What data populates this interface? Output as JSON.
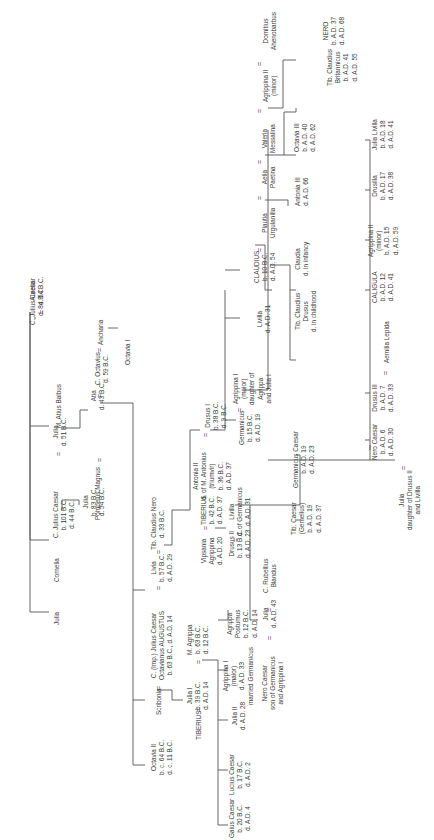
{
  "diagram": {
    "type": "family-tree",
    "orientation": "rotated-90-ccw",
    "line_color": "#555555",
    "text_color": "#3a3a3a",
    "marriage_symbol": "=",
    "nodes": [
      {
        "id": "caesar_sr",
        "lines": [
          "C. Julius Caesar",
          "d. 84 B.C."
        ],
        "x": 38,
        "y": 327
      },
      {
        "id": "aurelia",
        "lines": [
          "Aurelia",
          "d. 54 B.C."
        ],
        "x": 38,
        "y": 305
      },
      {
        "id": "julia_a",
        "lines": [
          "Julia"
        ],
        "x": 64,
        "y": 626
      },
      {
        "id": "cornelia",
        "lines": [
          "Cornelia"
        ],
        "x": 64,
        "y": 570
      },
      {
        "id": "caesar",
        "lines": [
          "C. Julius Caesar",
          "b. 101 B.C.",
          "d. 44 B.C."
        ],
        "x": 62,
        "y": 513
      },
      {
        "id": "julia_b",
        "lines": [
          "Julia",
          "d. 51 B.C."
        ],
        "x": 62,
        "y": 440
      },
      {
        "id": "balbus",
        "lines": [
          "M. Atius Balbus"
        ],
        "x": 62,
        "y": 380
      },
      {
        "id": "julia_c",
        "lines": [
          "Julia",
          "b. 83 B.C.",
          "d. 54 B.C."
        ],
        "x": 103,
        "y": 513
      },
      {
        "id": "pompey",
        "lines": [
          "Pompeius Magnus"
        ],
        "x": 103,
        "y": 450
      },
      {
        "id": "atia",
        "lines": [
          "Atia",
          "d. 43 B.C."
        ],
        "x": 103,
        "y": 400
      },
      {
        "id": "octavius",
        "lines": [
          "C. Octavius",
          "d. 59 B.C."
        ],
        "x": 103,
        "y": 360
      },
      {
        "id": "ancharia",
        "lines": [
          "Ancharia"
        ],
        "x": 103,
        "y": 310
      },
      {
        "id": "octavia1",
        "lines": [
          "Octavia I"
        ],
        "x": 130,
        "y": 365
      },
      {
        "id": "octavia2",
        "lines": [
          "Octavia II",
          "b. c. 64 B.C.",
          "d. c. 11 B.C."
        ],
        "x": 160,
        "y": 755
      },
      {
        "id": "scribonia",
        "lines": [
          "Scribonia"
        ],
        "x": 160,
        "y": 695
      },
      {
        "id": "augustus",
        "lines": [
          "C. (Imp.) Julius Caesar",
          "Octavianus AUGUSTUS",
          "b. 63 B.C., d. A.D. 14"
        ],
        "x": 160,
        "y": 660
      },
      {
        "id": "livia",
        "lines": [
          "Livia",
          "b. 57 B.C.",
          "d. A.D. 29"
        ],
        "x": 160,
        "y": 565
      },
      {
        "id": "tib_nero",
        "lines": [
          "Tib. Claudius Nero",
          "d. 33 B.C."
        ],
        "x": 160,
        "y": 520
      },
      {
        "id": "tiberius_a",
        "lines": [
          "TIBERIUS"
        ],
        "x": 198,
        "y": 735
      },
      {
        "id": "julia1",
        "lines": [
          "Julia I",
          "b. 39 B.C.",
          "d. A.D. 14"
        ],
        "x": 198,
        "y": 690
      },
      {
        "id": "agrippa",
        "lines": [
          "M. Agrippa",
          "b. 63 B.C.",
          "d. 12 B.C."
        ],
        "x": 198,
        "y": 635
      },
      {
        "id": "vipsania",
        "lines": [
          "Vipsania",
          "Agrippina",
          "d. A.D. 20"
        ],
        "x": 212,
        "y": 545
      },
      {
        "id": "tiberius",
        "lines": [
          "TIBERIUS",
          "b. 42 B.C.",
          "d. A.D. 37"
        ],
        "x": 212,
        "y": 505
      },
      {
        "id": "antonia2",
        "lines": [
          "Antonia II",
          "d. of M. Antonius",
          "(triumvir)",
          "b. 36 B.C.",
          "d. A.D. 37"
        ],
        "x": 210,
        "y": 470
      },
      {
        "id": "drusus1",
        "lines": [
          "Drusus I",
          "b. 38 B.C.",
          "d. 9 B.C."
        ],
        "x": 210,
        "y": 420
      },
      {
        "id": "gaius",
        "lines": [
          "Gaius Caesar",
          "b. 20 B.C.",
          "d. A.D. 4"
        ],
        "x": 236,
        "y": 838
      },
      {
        "id": "lucius",
        "lines": [
          "Lucius Caesar",
          "b. 17 B.C.",
          "d. A.D. 2"
        ],
        "x": 236,
        "y": 775
      },
      {
        "id": "julia2",
        "lines": [
          "Julia II",
          "d. A.D. 28"
        ],
        "x": 236,
        "y": 718
      },
      {
        "id": "agrippina1_a",
        "lines": [
          "Agrippina I",
          "(maior)",
          "d. A.D. 33",
          "married Germanicus"
        ],
        "x": 230,
        "y": 680
      },
      {
        "id": "postumus",
        "lines": [
          "Agrippa",
          "Postumus",
          "b. 12 B.C.",
          "d. A.D. 14"
        ],
        "x": 233,
        "y": 623
      },
      {
        "id": "drusus2",
        "lines": [
          "Drusus II",
          "b. 13 B.C.",
          "d. A.D. 23"
        ],
        "x": 236,
        "y": 545
      },
      {
        "id": "livilla_a",
        "lines": [
          "Livilla",
          "d. of Germanicus",
          "d. A.D. 31"
        ],
        "x": 236,
        "y": 508
      },
      {
        "id": "germanicus",
        "lines": [
          "Germanicus",
          "b. 15 B.C.",
          "d. A.D. 19"
        ],
        "x": 248,
        "y": 420
      },
      {
        "id": "agrippina1",
        "lines": [
          "Agrippina I",
          "(maior)",
          "daughter of",
          "Agrippa",
          "and Julia I"
        ],
        "x": 240,
        "y": 378
      },
      {
        "id": "livilla",
        "lines": [
          "Livilla",
          "d. A.D. 31"
        ],
        "x": 262,
        "y": 318
      },
      {
        "id": "claudius",
        "lines": [
          "CLAUDIUS",
          "b. 10 B.C.",
          "d. A.D. 54"
        ],
        "x": 258,
        "y": 265
      },
      {
        "id": "plautia",
        "lines": [
          "Plautia",
          "Urgulanilla"
        ],
        "x": 268,
        "y": 225
      },
      {
        "id": "aelia",
        "lines": [
          "Aelia",
          "Paetina"
        ],
        "x": 272,
        "y": 180
      },
      {
        "id": "valeria",
        "lines": [
          "Valeria",
          "Messalina"
        ],
        "x": 272,
        "y": 150
      },
      {
        "id": "agrippina2_a",
        "lines": [
          "Agrippina II",
          "(minor)"
        ],
        "x": 272,
        "y": 108
      },
      {
        "id": "domitius",
        "lines": [
          "Domitius",
          "Ahenobarbus"
        ],
        "x": 272,
        "y": 52
      },
      {
        "id": "nero_caesar_a",
        "lines": [
          "Nero Caesar",
          "son of Germanicus",
          "and Agrippina I"
        ],
        "x": 268,
        "y": 680
      },
      {
        "id": "julia3",
        "lines": [
          "Julia",
          "d. A.D. 43"
        ],
        "x": 268,
        "y": 618
      },
      {
        "id": "rubellius",
        "lines": [
          "C. Rubellius",
          "Blandus"
        ],
        "x": 268,
        "y": 585
      },
      {
        "id": "gemellus",
        "lines": [
          "Tib. Caesar",
          "(Gemellus)",
          "b. A.D. 19",
          "d. A.D. 37"
        ],
        "x": 300,
        "y": 520
      },
      {
        "id": "germ_caesar",
        "lines": [
          "Germanicus Caesar",
          "b. A.D. 19",
          "d. A.D. 23"
        ],
        "x": 300,
        "y": 470
      },
      {
        "id": "tib_drusus",
        "lines": [
          "Tib. Claudius",
          "Drusus",
          "d. in childhood"
        ],
        "x": 300,
        "y": 338
      },
      {
        "id": "claudia",
        "lines": [
          "Claudia",
          "d. in infancy"
        ],
        "x": 300,
        "y": 276
      },
      {
        "id": "antonia3",
        "lines": [
          "Antonia III",
          "d. A.D. 66"
        ],
        "x": 300,
        "y": 205
      },
      {
        "id": "octavia3",
        "lines": [
          "Octavia III",
          "b. A.D. 40",
          "d. A.D. 62"
        ],
        "x": 300,
        "y": 150
      },
      {
        "id": "britannicus",
        "lines": [
          "Tib. Claudius",
          "Britannicus",
          "b. A.D. 41",
          "d. A.D. 55"
        ],
        "x": 320,
        "y": 82
      },
      {
        "id": "nero",
        "lines": [
          "NERO",
          "b. A.D. 37",
          "d. A.D. 68"
        ],
        "x": 320,
        "y": 40
      },
      {
        "id": "nero_caesar",
        "lines": [
          "Nero Caesar",
          "b. A.D. 6",
          "d. A.D. 30"
        ],
        "x": 374,
        "y": 445
      },
      {
        "id": "drusus3",
        "lines": [
          "Drusus III",
          "b. A.D. 7",
          "d. A.D. 33"
        ],
        "x": 378,
        "y": 388
      },
      {
        "id": "aemilia",
        "lines": [
          "Aemilia Lepida"
        ],
        "x": 380,
        "y": 335
      },
      {
        "id": "caligula",
        "lines": [
          "CALIGULA",
          "b. A.D. 12",
          "d. A.D. 41"
        ],
        "x": 378,
        "y": 285
      },
      {
        "id": "agrippina2",
        "lines": [
          "Agrippina II",
          "(minor)",
          "b. A.D. 15",
          "d. A.D. 59"
        ],
        "x": 378,
        "y": 235
      },
      {
        "id": "drusilla",
        "lines": [
          "Drusilla",
          "b. A.D. 17",
          "d. A.D. 38"
        ],
        "x": 378,
        "y": 182
      },
      {
        "id": "julia_livilla",
        "lines": [
          "Julia Livilla",
          "b. A.D. 18",
          "d. A.D. 41"
        ],
        "x": 378,
        "y": 132
      },
      {
        "id": "julia4",
        "lines": [
          "Julia",
          "daughter of Drusus II",
          "and Livilla"
        ],
        "x": 406,
        "y": 505
      }
    ],
    "marriages": [
      {
        "x": 42,
        "y": 312
      },
      {
        "x": 66,
        "y": 452
      },
      {
        "x": 108,
        "y": 458
      },
      {
        "x": 108,
        "y": 405
      },
      {
        "x": 108,
        "y": 343
      },
      {
        "x": 166,
        "y": 700
      },
      {
        "x": 166,
        "y": 575
      },
      {
        "x": 166,
        "y": 528
      },
      {
        "x": 202,
        "y": 698
      },
      {
        "x": 204,
        "y": 658
      },
      {
        "x": 218,
        "y": 553
      },
      {
        "x": 218,
        "y": 515
      },
      {
        "x": 216,
        "y": 428
      },
      {
        "x": 252,
        "y": 380
      },
      {
        "x": 268,
        "y": 234
      },
      {
        "x": 268,
        "y": 196
      },
      {
        "x": 268,
        "y": 160
      },
      {
        "x": 268,
        "y": 125
      },
      {
        "x": 268,
        "y": 63
      },
      {
        "x": 274,
        "y": 635
      },
      {
        "x": 274,
        "y": 595
      },
      {
        "x": 384,
        "y": 340
      },
      {
        "x": 410,
        "y": 455
      }
    ]
  }
}
